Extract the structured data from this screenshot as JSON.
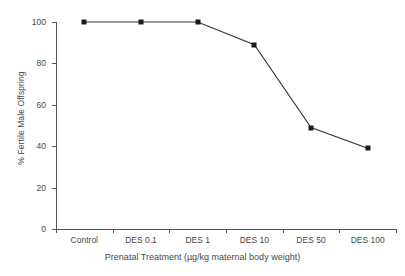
{
  "chart_data": {
    "type": "line",
    "title": "",
    "subtitle": "",
    "xlabel": "Prenatal Treatment (µg/kg maternal body weight)",
    "ylabel": "% Fertile Male Offspring",
    "categories": [
      "Control",
      "DES 0.1",
      "DES 1",
      "DES 10",
      "DES 50",
      "DES 100"
    ],
    "values": [
      100,
      100,
      100,
      89,
      49,
      39
    ],
    "series": [
      {
        "name": "% Fertile Male Offspring",
        "values": [
          100,
          100,
          100,
          89,
          49,
          39
        ]
      }
    ],
    "ylim": [
      0,
      100
    ],
    "yticks": [
      0,
      20,
      40,
      60,
      80,
      100
    ],
    "ytick_labels": [
      "0",
      "20",
      "40",
      "60",
      "80",
      "100"
    ],
    "grid": false,
    "legend": false,
    "legend_position": "none",
    "marker": "square",
    "marker_color": "#1a1a1a",
    "line_color": "#333333",
    "background_color": "#ffffff",
    "axis_color": "#555555"
  },
  "axes": {
    "y_title": "% Fertile Male Offspring",
    "x_title": "Prenatal Treatment (µg/kg maternal body weight)",
    "y_tick_0": "0",
    "y_tick_1": "20",
    "y_tick_2": "40",
    "y_tick_3": "60",
    "y_tick_4": "80",
    "y_tick_5": "100",
    "x_tick_0": "Control",
    "x_tick_1": "DES 0.1",
    "x_tick_2": "DES 1",
    "x_tick_3": "DES 10",
    "x_tick_4": "DES 50",
    "x_tick_5": "DES 100"
  }
}
